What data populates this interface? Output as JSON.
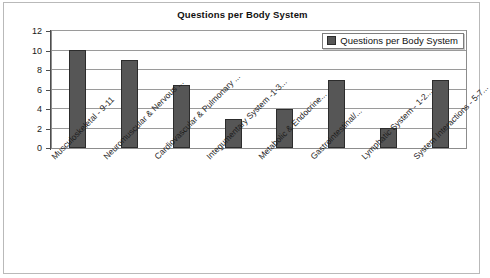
{
  "chart_data": {
    "type": "bar",
    "title": "Questions per Body System",
    "xlabel": "",
    "ylabel": "",
    "ylim": [
      0,
      12
    ],
    "ytick_step": 2,
    "yticks": [
      12,
      10,
      8,
      6,
      4,
      2,
      0
    ],
    "grid": true,
    "legend_position": "upper right",
    "categories": [
      "Musculoskeletal - 9-11",
      "Neuromuscular & Nervous ...",
      "Cardiovascular & Pulmonary ...",
      "Integumentary System -1-3...",
      "Metabolic & Endocrine...",
      "Gastrointestinal/...",
      "Lymphatic System - 1-2...",
      "System Interactions - 5-7..."
    ],
    "series": [
      {
        "name": "Questions per Body System",
        "values": [
          10,
          9,
          6.5,
          3,
          4,
          7,
          2,
          7
        ],
        "color": "#565656"
      }
    ]
  },
  "legend": {
    "entries": [
      {
        "label": "Questions per Body System",
        "color": "#565656"
      }
    ]
  },
  "colors": {
    "bar_fill": "#565656",
    "bar_stroke": "#2c2c2c",
    "gridline": "#9a9a9a",
    "axis": "#4d4d4d",
    "frame": "#b9b9b9",
    "plot_border": "#8c8c8c",
    "text": "#111111",
    "background": "#ffffff"
  }
}
